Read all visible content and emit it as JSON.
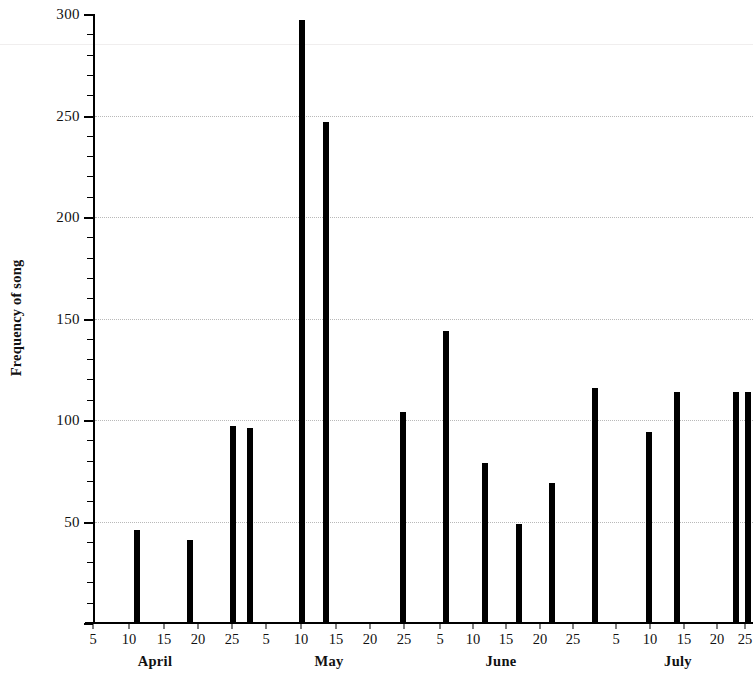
{
  "chart_data": {
    "type": "bar",
    "title": "",
    "xlabel": "",
    "ylabel": "Frequency of song",
    "ylim": [
      0,
      300
    ],
    "ytick_major_step": 50,
    "ytick_minor_step": 10,
    "ytick_labels": [
      "0",
      "50",
      "100",
      "150",
      "200",
      "250",
      "300"
    ],
    "ytick_labels_shown": [
      "50",
      "100",
      "150",
      "200",
      "250",
      "300"
    ],
    "grid": "horizontal dotted gridlines at 50, 100, 150, 200, 250",
    "legend": "none",
    "x_axis_type": "date",
    "x_months": [
      "April",
      "May",
      "June",
      "July"
    ],
    "x_day_ticks": [
      5,
      10,
      15,
      20,
      25
    ],
    "x_range": [
      "April 1",
      "July 27"
    ],
    "categories": [
      "April 12",
      "April 20",
      "April 28",
      "April 30",
      "May 10",
      "May 14",
      "May 27",
      "June 5",
      "June 11",
      "June 17",
      "June 22",
      "June 29",
      "July 10",
      "July 15",
      "July 25",
      "July 27"
    ],
    "values": [
      46,
      41,
      97,
      96,
      297,
      247,
      104,
      144,
      79,
      49,
      69,
      116,
      94,
      114,
      114,
      114
    ],
    "bars": [
      {
        "label": "April 12",
        "value": 46,
        "x_px": 137
      },
      {
        "label": "April 20",
        "value": 41,
        "x_px": 190
      },
      {
        "label": "April 28",
        "value": 97,
        "x_px": 233
      },
      {
        "label": "April 30",
        "value": 96,
        "x_px": 250
      },
      {
        "label": "May 10",
        "value": 297,
        "x_px": 302
      },
      {
        "label": "May 14",
        "value": 247,
        "x_px": 326
      },
      {
        "label": "May 27",
        "value": 104,
        "x_px": 403
      },
      {
        "label": "June 5",
        "value": 144,
        "x_px": 446
      },
      {
        "label": "June 11",
        "value": 79,
        "x_px": 485
      },
      {
        "label": "June 17",
        "value": 49,
        "x_px": 519
      },
      {
        "label": "June 22",
        "value": 69,
        "x_px": 552
      },
      {
        "label": "June 29",
        "value": 116,
        "x_px": 595
      },
      {
        "label": "July 10",
        "value": 94,
        "x_px": 649
      },
      {
        "label": "July 15",
        "value": 114,
        "x_px": 677
      },
      {
        "label": "July 25",
        "value": 114,
        "x_px": 736
      },
      {
        "label": "July 27",
        "value": 114,
        "x_px": 748
      }
    ],
    "bar_color": "#000000",
    "background_color": "#ffffff",
    "gridline_color": "#b9b9b9"
  },
  "axis": {
    "y_title": "Frequency of song",
    "y_labels": [
      {
        "text": "300",
        "value": 300
      },
      {
        "text": "250",
        "value": 250
      },
      {
        "text": "200",
        "value": 200
      },
      {
        "text": "150",
        "value": 150
      },
      {
        "text": "100",
        "value": 100
      },
      {
        "text": "50",
        "value": 50
      }
    ],
    "months": [
      {
        "name": "April",
        "center_px": 155,
        "days": [
          {
            "text": "5",
            "x_px": 93
          },
          {
            "text": "10",
            "x_px": 129
          },
          {
            "text": "15",
            "x_px": 164
          },
          {
            "text": "20",
            "x_px": 198
          },
          {
            "text": "25",
            "x_px": 232
          }
        ]
      },
      {
        "name": "May",
        "center_px": 329,
        "days": [
          {
            "text": "5",
            "x_px": 266
          },
          {
            "text": "10",
            "x_px": 301
          },
          {
            "text": "15",
            "x_px": 336
          },
          {
            "text": "20",
            "x_px": 370
          },
          {
            "text": "25",
            "x_px": 404
          }
        ]
      },
      {
        "name": "June",
        "center_px": 501,
        "days": [
          {
            "text": "5",
            "x_px": 440
          },
          {
            "text": "10",
            "x_px": 473
          },
          {
            "text": "15",
            "x_px": 506
          },
          {
            "text": "20",
            "x_px": 540
          },
          {
            "text": "25",
            "x_px": 573
          }
        ]
      },
      {
        "name": "July",
        "center_px": 678,
        "days": [
          {
            "text": "5",
            "x_px": 616
          },
          {
            "text": "10",
            "x_px": 650
          },
          {
            "text": "15",
            "x_px": 684
          },
          {
            "text": "20",
            "x_px": 717
          },
          {
            "text": "25",
            "x_px": 745
          }
        ]
      }
    ]
  }
}
